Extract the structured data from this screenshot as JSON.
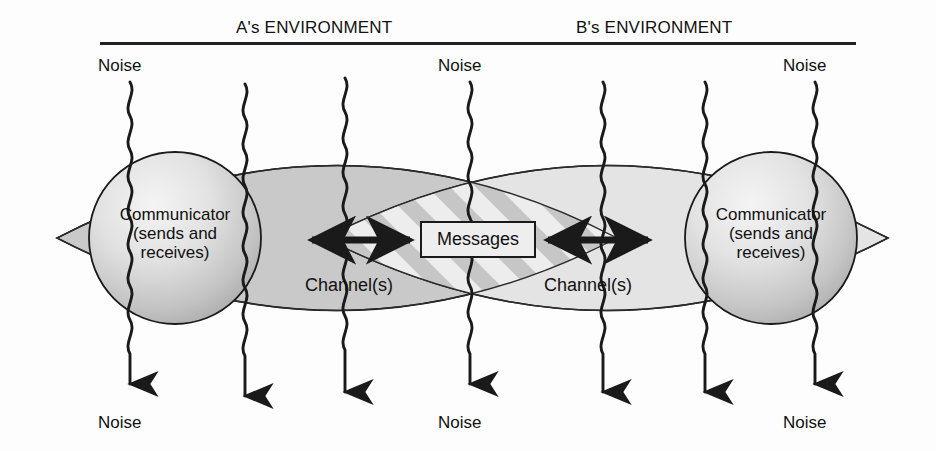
{
  "diagram": {
    "header": {
      "left_environment": "A's ENVIRONMENT",
      "right_environment": "B's ENVIRONMENT"
    },
    "noise_labels": [
      {
        "id": "noise-top-left",
        "text": "Noise"
      },
      {
        "id": "noise-top-center",
        "text": "Noise"
      },
      {
        "id": "noise-top-right",
        "text": "Noise"
      },
      {
        "id": "noise-bottom-left",
        "text": "Noise"
      },
      {
        "id": "noise-bottom-center",
        "text": "Noise"
      },
      {
        "id": "noise-bottom-right",
        "text": "Noise"
      }
    ],
    "communicators": [
      {
        "id": "communicator-a",
        "line1": "Communicator",
        "line2": "(sends and",
        "line3": "receives)"
      },
      {
        "id": "communicator-b",
        "line1": "Communicator",
        "line2": "(sends and",
        "line3": "receives)"
      }
    ],
    "channels": [
      {
        "id": "channel-left",
        "text": "Channel(s)"
      },
      {
        "id": "channel-right",
        "text": "Channel(s)"
      }
    ],
    "messages_box": {
      "label": "Messages"
    },
    "colors": {
      "left_lens_fill": "#c8c8c8",
      "right_lens_fill": "#e0e0e0",
      "overlap_stripe_dark": "#c4c4c4",
      "overlap_stripe_light": "#ededed",
      "stroke": "#1a1a1a",
      "text": "#111111",
      "sphere_highlight": "#f2f2f2",
      "sphere_shadow": "#a8a8a8",
      "background": "#fdfdfd",
      "rule": "#222222"
    },
    "geometry": {
      "rule_y": 43,
      "rule_x1": 100,
      "rule_x2": 856,
      "lens_left": {
        "tip_left_x": 57,
        "tip_right_x": 617,
        "top_y": 93,
        "bottom_y": 383,
        "center_y": 238
      },
      "lens_right": {
        "tip_left_x": 325,
        "tip_right_x": 888,
        "top_y": 93,
        "bottom_y": 383,
        "center_y": 238
      },
      "sphere_left": {
        "cx": 175,
        "cy": 238,
        "r": 86
      },
      "sphere_right": {
        "cx": 771,
        "cy": 238,
        "r": 86
      },
      "noise_line_x": [
        130,
        245,
        345,
        470,
        603,
        705,
        815
      ],
      "arrow_left": {
        "x1": 308,
        "x2": 412,
        "y": 240
      },
      "arrow_right": {
        "x1": 650,
        "x2": 545,
        "y": 240
      }
    }
  }
}
